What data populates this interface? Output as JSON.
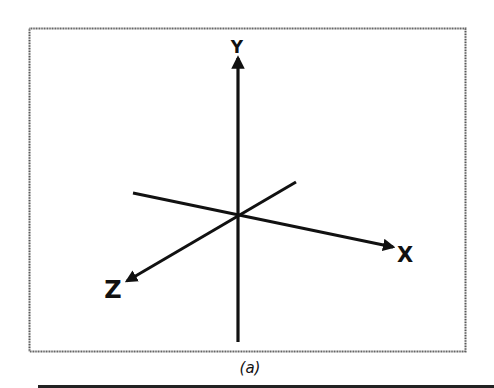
{
  "figure": {
    "caption": "(a)",
    "colors": {
      "frame": "#555555",
      "axes": "#111111",
      "background": "#ffffff"
    },
    "axes": {
      "x": {
        "label": "X",
        "from": [
          133,
          193
        ],
        "to": [
          395,
          247
        ]
      },
      "y": {
        "label": "Y",
        "from": [
          238,
          342
        ],
        "to": [
          238,
          55
        ]
      },
      "z": {
        "label": "Z",
        "from": [
          296,
          182
        ],
        "to": [
          125,
          282
        ]
      }
    },
    "origin": [
      238,
      216
    ]
  }
}
